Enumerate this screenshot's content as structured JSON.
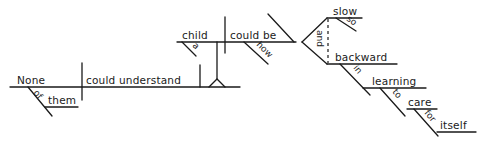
{
  "diagram": {
    "type": "Reed-Kellogg sentence diagram",
    "main_clause": {
      "subject": "None",
      "subject_modifier_prep": "of",
      "subject_modifier_object": "them",
      "verb": "could understand"
    },
    "noun_clause": {
      "subject": "child",
      "subject_modifier": "a",
      "verb": "could be",
      "adverb": "how"
    },
    "complements": {
      "conjunction": "and",
      "first": "slow",
      "first_modifier": "so",
      "second": "backward",
      "prep1": "in",
      "prep1_object": "learning",
      "infinitive_marker": "to",
      "infinitive_verb": "care",
      "prep2": "for",
      "prep2_object": "itself"
    }
  }
}
